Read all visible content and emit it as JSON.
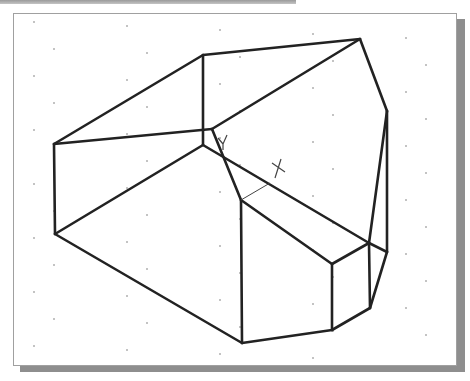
{
  "canvas": {
    "background": "#ffffff",
    "frame_border": "#a0a0a0",
    "shadow": "#8e8e8e",
    "line_color": "#222222",
    "grid_dot_color": "#777777"
  },
  "drawing": {
    "type": "isometric wireframe solid",
    "vertices": {
      "A": [
        54,
        144
      ],
      "B": [
        203,
        55
      ],
      "T": [
        360,
        39
      ],
      "R": [
        387,
        111
      ],
      "C": [
        212,
        129
      ],
      "D": [
        203,
        145
      ],
      "E": [
        241,
        200
      ],
      "F": [
        332,
        264
      ],
      "G": [
        369,
        243
      ],
      "H": [
        387,
        252
      ],
      "L": [
        55,
        234
      ],
      "P": [
        242,
        343
      ],
      "Q": [
        332,
        330
      ],
      "S": [
        370,
        308
      ]
    },
    "edges": [
      [
        "A",
        "B"
      ],
      [
        "B",
        "T"
      ],
      [
        "T",
        "R"
      ],
      [
        "A",
        "C"
      ],
      [
        "C",
        "T"
      ],
      [
        "B",
        "D"
      ],
      [
        "A",
        "L"
      ],
      [
        "D",
        "L"
      ],
      [
        "C",
        "E"
      ],
      [
        "D",
        "G"
      ],
      [
        "E",
        "F"
      ],
      [
        "F",
        "G"
      ],
      [
        "R",
        "G"
      ],
      [
        "R",
        "H"
      ],
      [
        "G",
        "H"
      ],
      [
        "L",
        "P"
      ],
      [
        "E",
        "P"
      ],
      [
        "F",
        "Q"
      ],
      [
        "G",
        "S"
      ],
      [
        "H",
        "S"
      ],
      [
        "S",
        "Q"
      ],
      [
        "P",
        "Q"
      ]
    ],
    "construction_lines": [
      [
        [
          241,
          200
        ],
        [
          270,
          183
        ]
      ]
    ],
    "markers": [
      {
        "name": "ucs-y-marker",
        "at": [
          223,
          140
        ]
      },
      {
        "name": "snap-cross-marker",
        "at": [
          278,
          168
        ]
      }
    ]
  }
}
